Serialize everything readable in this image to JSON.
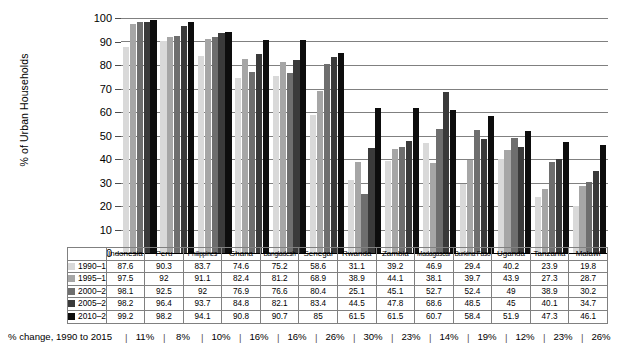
{
  "chart_data": {
    "type": "bar",
    "title": "",
    "xlabel": "",
    "ylabel": "% of Urban Households",
    "ylim": [
      0,
      100
    ],
    "ytick_step": 10,
    "grid": true,
    "legend_position": "table-left",
    "categories": [
      "Indonesia",
      "Peru",
      "Philippines",
      "Ghana",
      "Bangladesh",
      "Senegal",
      "Rwanda",
      "Zambia",
      "Madagascar",
      "Burkina Faso",
      "Uganda",
      "Tanzania",
      "Malawi"
    ],
    "yticks": [
      "100",
      "90",
      "80",
      "70",
      "60",
      "50",
      "40",
      "30",
      "20",
      "10",
      "0"
    ],
    "series": [
      {
        "name": "1990–1994",
        "color": "#d9d9d9",
        "values": [
          87.6,
          90.3,
          83.7,
          74.6,
          75.2,
          58.6,
          31.1,
          39.2,
          46.9,
          29.4,
          40.2,
          23.9,
          19.8
        ]
      },
      {
        "name": "1995–1999",
        "color": "#a6a6a6",
        "values": [
          97.5,
          92,
          91.1,
          82.4,
          81.2,
          68.9,
          38.9,
          44.1,
          38.1,
          39.7,
          43.9,
          27.3,
          28.7
        ]
      },
      {
        "name": "2000–2004",
        "color": "#6e6e6e",
        "values": [
          98.1,
          92.5,
          92,
          76.9,
          76.6,
          80.4,
          25.1,
          45.1,
          52.7,
          52.4,
          49,
          38.9,
          30.2
        ]
      },
      {
        "name": "2005–2009",
        "color": "#3a3a3a",
        "values": [
          98.2,
          96.4,
          93.7,
          84.8,
          82.1,
          83.4,
          44.5,
          47.8,
          68.6,
          48.5,
          45,
          40.1,
          34.7
        ]
      },
      {
        "name": "2010–2015",
        "color": "#0d0d0d",
        "values": [
          99.2,
          98.2,
          94.1,
          90.8,
          90.7,
          85,
          61.5,
          61.5,
          60.7,
          58.4,
          51.9,
          47.3,
          46.1
        ]
      }
    ],
    "percent_change_label": "% change, 1990 to 2015",
    "percent_change": [
      "11%",
      "8%",
      "10%",
      "16%",
      "16%",
      "26%",
      "30%",
      "23%",
      "14%",
      "19%",
      "12%",
      "23%",
      "26%"
    ]
  },
  "table": {
    "corner_label": "",
    "column_headers": [
      "Indonesia",
      "Peru",
      "Philippines",
      "Ghana",
      "Bangladesh",
      "Senegal",
      "Rwanda",
      "Zambia",
      "Madagascar",
      "Burkina Faso",
      "Uganda",
      "Tanzania",
      "Malawi"
    ],
    "rows": [
      {
        "label": "1990–1994",
        "color": "#d9d9d9",
        "cells": [
          "87.6",
          "90.3",
          "83.7",
          "74.6",
          "75.2",
          "58.6",
          "31.1",
          "39.2",
          "46.9",
          "29.4",
          "40.2",
          "23.9",
          "19.8"
        ]
      },
      {
        "label": "1995–1999",
        "color": "#a6a6a6",
        "cells": [
          "97.5",
          "92",
          "91.1",
          "82.4",
          "81.2",
          "68.9",
          "38.9",
          "44.1",
          "38.1",
          "39.7",
          "43.9",
          "27.3",
          "28.7"
        ]
      },
      {
        "label": "2000–2004",
        "color": "#6e6e6e",
        "cells": [
          "98.1",
          "92.5",
          "92",
          "76.9",
          "76.6",
          "80.4",
          "25.1",
          "45.1",
          "52.7",
          "52.4",
          "49",
          "38.9",
          "30.2"
        ]
      },
      {
        "label": "2005–2009",
        "color": "#3a3a3a",
        "cells": [
          "98.2",
          "96.4",
          "93.7",
          "84.8",
          "82.1",
          "83.4",
          "44.5",
          "47.8",
          "68.6",
          "48.5",
          "45",
          "40.1",
          "34.7"
        ]
      },
      {
        "label": "2010–2015",
        "color": "#0d0d0d",
        "cells": [
          "99.2",
          "98.2",
          "94.1",
          "90.8",
          "90.7",
          "85",
          "61.5",
          "61.5",
          "60.7",
          "58.4",
          "51.9",
          "47.3",
          "46.1"
        ]
      }
    ]
  },
  "change_row": {
    "label": "% change, 1990 to 2015",
    "values": [
      "11%",
      "8%",
      "10%",
      "16%",
      "16%",
      "26%",
      "30%",
      "23%",
      "14%",
      "19%",
      "12%",
      "23%",
      "26%"
    ]
  }
}
